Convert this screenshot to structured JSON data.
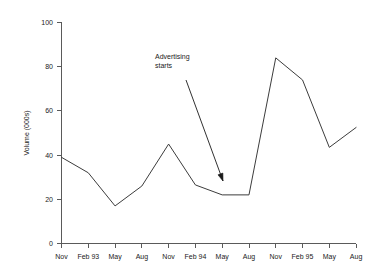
{
  "chart_data": {
    "type": "line",
    "title": "",
    "xlabel": "",
    "ylabel": "Volume (000s)",
    "ylim": [
      0,
      100
    ],
    "yticks": [
      0,
      20,
      40,
      60,
      80,
      100
    ],
    "ytick_labels": [
      "0",
      "20",
      "40",
      "60",
      "80",
      "100"
    ],
    "grid": false,
    "legend": "none",
    "categories": [
      "Nov",
      "Feb 93",
      "May",
      "Aug",
      "Nov",
      "Feb 94",
      "May",
      "Aug",
      "Nov",
      "Feb 95",
      "May",
      "Aug"
    ],
    "values": [
      39,
      32,
      17,
      26,
      45,
      26.5,
      22,
      22,
      84,
      74,
      43.5,
      52.5
    ],
    "series": [
      {
        "name": "Volume",
        "values": [
          39,
          32,
          17,
          26,
          45,
          26.5,
          22,
          22,
          84,
          74,
          43.5,
          52.5
        ],
        "color": "#3c3c3c"
      }
    ],
    "annotations": [
      {
        "text_line1": "Advertising",
        "text_line2": "starts",
        "text_x": 155,
        "text_y": 59,
        "arrow_from_x": 186,
        "arrow_from_y": 80,
        "arrow_to_x": 223,
        "arrow_to_y": 181
      }
    ]
  },
  "axes": {
    "y_axis_title": "Volume (000s)",
    "x_axis_title": ""
  },
  "colors": {
    "line": "#3c3c3c",
    "axis": "#5a5a5a",
    "text": "#1a1a1a",
    "background": "#ffffff"
  }
}
